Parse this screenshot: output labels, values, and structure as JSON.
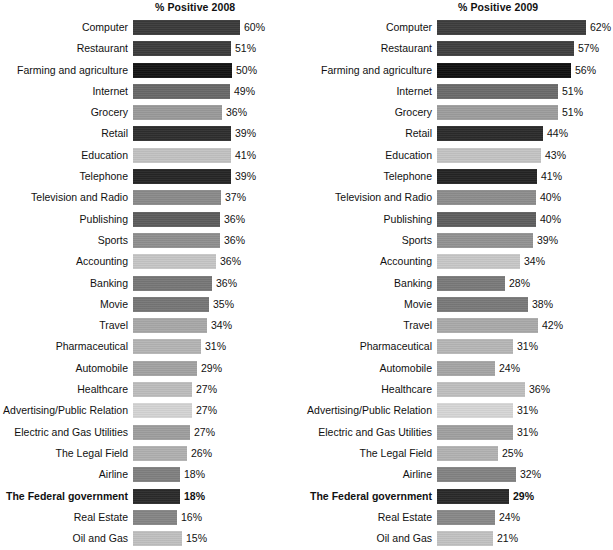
{
  "panels": [
    {
      "title": "% Positive 2008",
      "year": "2008"
    },
    {
      "title": "% Positive 2009",
      "year": "2009"
    }
  ],
  "chart_data": {
    "type": "bar",
    "xlabel": "",
    "ylabel": "",
    "orientation": "horizontal",
    "grid": false,
    "legend": "none",
    "categories": [
      "Computer",
      "Restaurant",
      "Farming and agriculture",
      "Internet",
      "Grocery",
      "Retail",
      "Education",
      "Telephone",
      "Television and Radio",
      "Publishing",
      "Sports",
      "Accounting",
      "Banking",
      "Movie",
      "Travel",
      "Pharmaceutical",
      "Automobile",
      "Healthcare",
      "Advertising/Public Relation",
      "Electric and Gas Utilities",
      "The Legal Field",
      "Airline",
      "The Federal government",
      "Real Estate",
      "Oil and Gas"
    ],
    "highlight_category": "The Federal government",
    "series": [
      {
        "name": "% Positive 2008",
        "values": [
          60,
          51,
          50,
          49,
          36,
          39,
          41,
          39,
          37,
          36,
          36,
          36,
          36,
          35,
          34,
          31,
          29,
          27,
          27,
          27,
          26,
          18,
          18,
          16,
          15
        ],
        "labels": [
          "60%",
          "51%",
          "50%",
          "49%",
          "36%",
          "39%",
          "41%",
          "39%",
          "37%",
          "36%",
          "36%",
          "36%",
          "36%",
          "35%",
          "34%",
          "31%",
          "29%",
          "27%",
          "27%",
          "27%",
          "26%",
          "18%",
          "18%",
          "16%",
          "15%"
        ],
        "bar_px": [
          107,
          98,
          99,
          97,
          89,
          98,
          98,
          98,
          88,
          87,
          87,
          83,
          79,
          76,
          74,
          68,
          64,
          59,
          59,
          57,
          54,
          47,
          47,
          44,
          49
        ],
        "bar_colors": [
          "#3a3a3a",
          "#3c3c3c",
          "#141414",
          "#686868",
          "#9a9a9a",
          "#2e2e2e",
          "#c2c2c2",
          "#252525",
          "#8a8a8a",
          "#5d5d5d",
          "#8f8f8f",
          "#c6c6c6",
          "#777777",
          "#767676",
          "#a8a8a8",
          "#b4b4b4",
          "#a2a2a2",
          "#bdbdbd",
          "#d4d4d4",
          "#9e9e9e",
          "#b0b0b0",
          "#808080",
          "#2a2a2a",
          "#858585",
          "#c0c0c0"
        ]
      },
      {
        "name": "% Positive 2009",
        "values": [
          62,
          57,
          56,
          51,
          51,
          44,
          43,
          41,
          40,
          40,
          39,
          34,
          28,
          38,
          42,
          31,
          24,
          36,
          31,
          31,
          25,
          32,
          29,
          24,
          21
        ],
        "labels": [
          "62%",
          "57%",
          "56%",
          "51%",
          "51%",
          "44%",
          "43%",
          "41%",
          "40%",
          "40%",
          "39%",
          "34%",
          "28%",
          "38%",
          "42%",
          "31%",
          "24%",
          "36%",
          "31%",
          "31%",
          "25%",
          "32%",
          "29%",
          "24%",
          "21%"
        ],
        "bar_px": [
          149,
          137,
          134,
          121,
          121,
          106,
          104,
          100,
          99,
          99,
          96,
          83,
          68,
          91,
          101,
          76,
          58,
          88,
          76,
          76,
          61,
          79,
          72,
          58,
          56
        ],
        "bar_colors": [
          "#3d3d3d",
          "#3f3f3f",
          "#101010",
          "#6b6b6b",
          "#9d9d9d",
          "#2b2b2b",
          "#c4c4c4",
          "#242424",
          "#8d8d8d",
          "#5f5f5f",
          "#929292",
          "#c8c8c8",
          "#7a7a7a",
          "#797979",
          "#aaaaaa",
          "#b6b6b6",
          "#a5a5a5",
          "#bfbfbf",
          "#d6d6d6",
          "#a0a0a0",
          "#b2b2b2",
          "#838383",
          "#292929",
          "#888888",
          "#c2c2c2"
        ]
      }
    ]
  }
}
